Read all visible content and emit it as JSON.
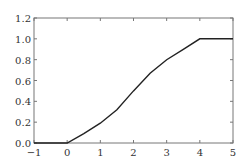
{
  "chart_data": {
    "type": "line",
    "title": "",
    "xlabel": "",
    "ylabel": "",
    "xlim": [
      -1,
      5
    ],
    "ylim": [
      0,
      1.2
    ],
    "grid": false,
    "xticks": [
      "−1",
      "0",
      "1",
      "2",
      "3",
      "4",
      "5"
    ],
    "yticks": [
      "0.0",
      "0.2",
      "0.4",
      "0.6",
      "0.8",
      "1.0",
      "1.2"
    ],
    "series": [
      {
        "name": "F(x)",
        "color": "#222222",
        "x": [
          -1,
          0,
          0.5,
          1,
          1.5,
          2,
          2.5,
          3,
          3.5,
          4,
          5
        ],
        "y": [
          0,
          0,
          0.09,
          0.19,
          0.32,
          0.5,
          0.67,
          0.8,
          0.9,
          1.0,
          1.0
        ]
      }
    ]
  }
}
